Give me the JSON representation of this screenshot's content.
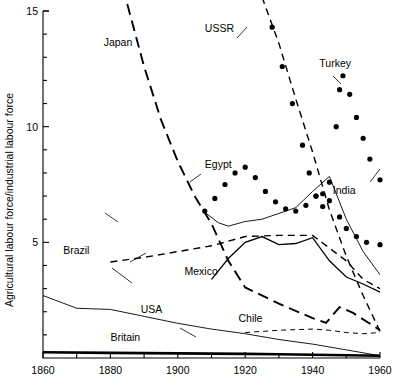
{
  "chart_data": {
    "type": "line",
    "title": "",
    "xlabel": "",
    "ylabel": "Agricultural labour force/industrial labour force",
    "xlim": [
      1860,
      1960
    ],
    "ylim": [
      0,
      15
    ],
    "grid": false,
    "legend_position": "inline-labels",
    "x_ticks_major": [
      1860,
      1880,
      1900,
      1920,
      1940,
      1960
    ],
    "x_ticks_major_labels": [
      "1860",
      "1880",
      "1900",
      "1920",
      "1940",
      "1960"
    ],
    "x_ticks_minor": [
      1870,
      1890,
      1910,
      1930,
      1950
    ],
    "y_ticks_major": [
      5,
      10,
      15
    ],
    "y_ticks_major_labels": [
      "5",
      "10",
      "15"
    ],
    "y_ticks_minor": [
      1,
      2,
      3,
      4,
      6,
      7,
      8,
      9,
      11,
      12,
      13,
      14
    ],
    "series": [
      {
        "name": "Japan",
        "style": "long-dash",
        "label_x": 1878,
        "label_y": 13.5,
        "points": [
          [
            1885,
            15.3
          ],
          [
            1890,
            12.6
          ],
          [
            1895,
            10.3
          ],
          [
            1900,
            8.5
          ],
          [
            1905,
            7.0
          ],
          [
            1910,
            5.8
          ],
          [
            1915,
            4.2
          ],
          [
            1920,
            3.05
          ],
          [
            1930,
            2.35
          ],
          [
            1940,
            1.72
          ],
          [
            1944,
            1.52
          ],
          [
            1948,
            2.2
          ],
          [
            1952,
            1.95
          ],
          [
            1960,
            1.2
          ]
        ]
      },
      {
        "name": "USSR",
        "style": "dash",
        "label_x": 1908,
        "label_y": 14.1,
        "points": [
          [
            1925,
            15.6
          ],
          [
            1930,
            13.6
          ],
          [
            1935,
            11.2
          ],
          [
            1940,
            8.9
          ],
          [
            1945,
            6.4
          ],
          [
            1950,
            4.4
          ],
          [
            1955,
            2.7
          ],
          [
            1960,
            1.15
          ]
        ]
      },
      {
        "name": "Turkey",
        "style": "dotted",
        "label_x": 1942,
        "label_y": 12.6,
        "points": [
          [
            1925,
            15.6
          ],
          [
            1928,
            14.3
          ],
          [
            1931,
            12.6
          ],
          [
            1934,
            11.0
          ],
          [
            1937,
            9.2
          ],
          [
            1939,
            8.0
          ],
          [
            1941,
            7.0
          ],
          [
            1943,
            6.55
          ],
          [
            1945,
            7.6
          ],
          [
            1947,
            10.0
          ],
          [
            1948,
            11.6
          ],
          [
            1949,
            12.2
          ],
          [
            1951,
            11.4
          ],
          [
            1953,
            10.4
          ],
          [
            1955,
            9.5
          ],
          [
            1957,
            8.6
          ],
          [
            1960,
            7.7
          ]
        ]
      },
      {
        "name": "Egypt",
        "style": "dotted",
        "label_x": 1908,
        "label_y": 8.2,
        "points": [
          [
            1908,
            6.35
          ],
          [
            1911,
            6.9
          ],
          [
            1914,
            7.5
          ],
          [
            1917,
            8.0
          ],
          [
            1920,
            8.25
          ],
          [
            1923,
            7.8
          ],
          [
            1926,
            7.2
          ],
          [
            1929,
            6.75
          ],
          [
            1932,
            6.45
          ],
          [
            1935,
            6.35
          ],
          [
            1938,
            6.6
          ],
          [
            1941,
            7.0
          ],
          [
            1943,
            7.1
          ],
          [
            1945,
            6.8
          ],
          [
            1948,
            6.1
          ],
          [
            1950,
            5.6
          ],
          [
            1953,
            5.25
          ],
          [
            1956,
            5.0
          ],
          [
            1960,
            4.9
          ]
        ]
      },
      {
        "name": "India",
        "style": "thin-solid",
        "label_x": 1946,
        "label_y": 7.1,
        "points": [
          [
            1908,
            6.3
          ],
          [
            1912,
            5.85
          ],
          [
            1915,
            5.7
          ],
          [
            1920,
            5.9
          ],
          [
            1925,
            6.0
          ],
          [
            1930,
            6.25
          ],
          [
            1935,
            6.5
          ],
          [
            1940,
            7.2
          ],
          [
            1945,
            7.85
          ],
          [
            1950,
            6.0
          ],
          [
            1955,
            4.6
          ],
          [
            1960,
            3.6
          ]
        ]
      },
      {
        "name": "Brazil",
        "style": "dash",
        "label_x": 1866,
        "label_y": 4.5,
        "points": [
          [
            1880,
            4.15
          ],
          [
            1890,
            4.35
          ],
          [
            1900,
            4.6
          ],
          [
            1910,
            4.85
          ],
          [
            1920,
            5.25
          ],
          [
            1930,
            5.3
          ],
          [
            1940,
            5.3
          ],
          [
            1950,
            4.2
          ],
          [
            1955,
            3.4
          ],
          [
            1960,
            3.0
          ]
        ]
      },
      {
        "name": "Mexico",
        "style": "solid",
        "label_x": 1902,
        "label_y": 3.6,
        "points": [
          [
            1910,
            3.4
          ],
          [
            1915,
            4.3
          ],
          [
            1920,
            5.0
          ],
          [
            1925,
            5.25
          ],
          [
            1930,
            4.9
          ],
          [
            1935,
            4.95
          ],
          [
            1940,
            5.2
          ],
          [
            1945,
            4.2
          ],
          [
            1950,
            3.5
          ],
          [
            1955,
            3.2
          ],
          [
            1960,
            2.85
          ]
        ]
      },
      {
        "name": "USA",
        "style": "thin-solid",
        "label_x": 1889,
        "label_y": 1.95,
        "points": [
          [
            1860,
            2.7
          ],
          [
            1870,
            2.15
          ],
          [
            1880,
            2.1
          ],
          [
            1890,
            1.8
          ],
          [
            1900,
            1.5
          ],
          [
            1910,
            1.25
          ],
          [
            1920,
            1.05
          ],
          [
            1930,
            0.8
          ],
          [
            1940,
            0.6
          ],
          [
            1950,
            0.35
          ],
          [
            1960,
            0.1
          ]
        ]
      },
      {
        "name": "Chile",
        "style": "fine-dash",
        "label_x": 1918,
        "label_y": 1.55,
        "points": [
          [
            1920,
            1.1
          ],
          [
            1930,
            1.2
          ],
          [
            1940,
            1.25
          ],
          [
            1945,
            1.2
          ],
          [
            1950,
            1.1
          ],
          [
            1955,
            1.05
          ],
          [
            1960,
            1.1
          ]
        ]
      },
      {
        "name": "Britain",
        "style": "thick-solid",
        "label_x": 1880,
        "label_y": 0.72,
        "points": [
          [
            1860,
            0.25
          ],
          [
            1880,
            0.22
          ],
          [
            1900,
            0.2
          ],
          [
            1920,
            0.18
          ],
          [
            1930,
            0.16
          ],
          [
            1940,
            0.14
          ],
          [
            1950,
            0.12
          ],
          [
            1960,
            0.1
          ]
        ]
      }
    ]
  }
}
